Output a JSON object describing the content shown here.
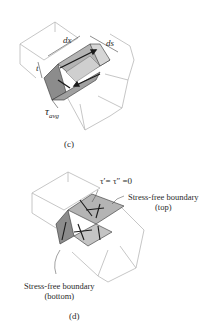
{
  "panels": [
    {
      "id": "c",
      "caption": "(c)",
      "labels": {
        "dx": "dx",
        "ds": "ds",
        "t": "t",
        "tau_avg": "τ",
        "tau_avg_sub": "avg"
      }
    },
    {
      "id": "d",
      "caption": "(d)",
      "labels": {
        "tau_eq": "τ′= τ″ =0",
        "top_boundary_line1": "Stress-free boundary",
        "top_boundary_line2": "(top)",
        "bottom_boundary_line1": "Stress-free boundary",
        "bottom_boundary_line2": "(bottom)"
      }
    }
  ],
  "colors": {
    "outline": "#b8b8b8",
    "element_dark": "#8c8c8c",
    "element_mid": "#b4b4b4",
    "element_light": "#d6d6d6",
    "arrow": "#1a1a1a"
  }
}
